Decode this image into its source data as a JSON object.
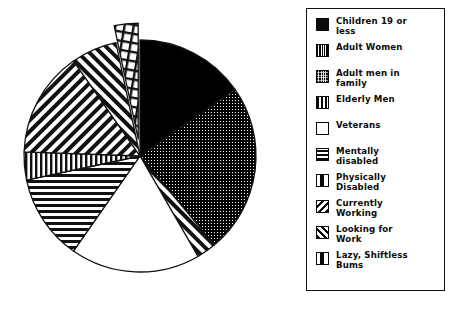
{
  "chart_data": {
    "type": "pie",
    "title": "",
    "subtitle": "",
    "xlabel": "",
    "ylabel": "",
    "legend_position": "right",
    "grid": false,
    "categories": [
      "Children 19 or less",
      "Adult Women",
      "Adult men in family",
      "Elderly Men",
      "Veterans",
      "Mentally disabled",
      "Physically Disabled",
      "Currently Working",
      "Looking for Work",
      "Lazy, Shiftless Bums"
    ],
    "values": [
      15.3,
      23.6,
      2.8,
      0.0,
      18.1,
      11.9,
      3.9,
      14.7,
      6.4,
      3.3
    ],
    "slices": [
      {
        "label": "Children 19 or less",
        "value": 15.3,
        "start_deg": 0,
        "end_deg": 55,
        "pattern": "solid-black",
        "exploded": false
      },
      {
        "label": "Adult Women",
        "value": 23.6,
        "start_deg": 55,
        "end_deg": 140,
        "pattern": "dense-dots",
        "exploded": false
      },
      {
        "label": "Adult men in family",
        "value": 2.8,
        "start_deg": 140,
        "end_deg": 150,
        "pattern": "diagonal-back",
        "exploded": false
      },
      {
        "label": "Elderly Men",
        "value": 0.0,
        "start_deg": 150,
        "end_deg": 150,
        "pattern": "vertical-wide",
        "exploded": false
      },
      {
        "label": "Veterans",
        "value": 18.1,
        "start_deg": 150,
        "end_deg": 215,
        "pattern": "white",
        "exploded": false
      },
      {
        "label": "Mentally disabled",
        "value": 11.9,
        "start_deg": 215,
        "end_deg": 258,
        "pattern": "horizontal",
        "exploded": false
      },
      {
        "label": "Physically Disabled",
        "value": 3.9,
        "start_deg": 258,
        "end_deg": 272,
        "pattern": "vertical",
        "exploded": false
      },
      {
        "label": "Currently Working",
        "value": 14.7,
        "start_deg": 272,
        "end_deg": 325,
        "pattern": "diagonal-fwd",
        "exploded": false
      },
      {
        "label": "Looking for Work",
        "value": 6.4,
        "start_deg": 325,
        "end_deg": 348,
        "pattern": "diagonal-back",
        "exploded": false
      },
      {
        "label": "Lazy, Shiftless Bums",
        "value": 3.3,
        "start_deg": 348,
        "end_deg": 360,
        "pattern": "grid",
        "exploded": true
      }
    ],
    "colors": {
      "stroke": "#111111",
      "fill_black": "#000000",
      "fill_white": "#ffffff",
      "background": "#ffffff"
    }
  },
  "legend": {
    "items": [
      {
        "label": "Children 19 or\nless",
        "swatch": "swatch-solid-black"
      },
      {
        "label": "Adult Women",
        "swatch": "swatch-dense-vertical"
      },
      {
        "label": "Adult men in\nfamily",
        "swatch": "swatch-dense-dots"
      },
      {
        "label": "Elderly Men",
        "swatch": "swatch-vertical-wide"
      },
      {
        "label": "Veterans",
        "swatch": "swatch-white"
      },
      {
        "label": "Mentally\ndisabled",
        "swatch": "swatch-horizontal"
      },
      {
        "label": "Physically\nDisabled",
        "swatch": "swatch-center-bar"
      },
      {
        "label": "Currently\nWorking",
        "swatch": "swatch-diagonal-back"
      },
      {
        "label": "Looking for\nWork",
        "swatch": "swatch-diagonal-fwd"
      },
      {
        "label": "Lazy, Shiftless\nBums",
        "swatch": "swatch-center-bar-2"
      }
    ]
  }
}
